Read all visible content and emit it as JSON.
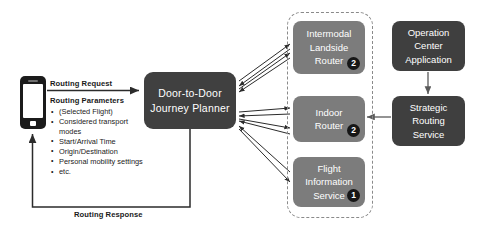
{
  "diagram": {
    "colors": {
      "dark_node": "#3f3f3f",
      "gray_node": "#7c7c7c",
      "badge": "#161616",
      "dashed_border": "#8a8a8a",
      "background": "#ffffff",
      "text_on_node": "#ffffff",
      "label_text": "#1a1a1a"
    }
  },
  "client": {
    "device_icon": "smartphone-icon"
  },
  "edges": {
    "routing_request_label": "Routing Request",
    "routing_response_label": "Routing Response"
  },
  "parameters": {
    "title": "Routing Parameters",
    "items": [
      "(Selected Flight)",
      "Considered transport modes",
      "Start/Arrival Time",
      "Origin/Destination",
      "Personal mobility settings",
      "etc."
    ]
  },
  "nodes": {
    "planner": {
      "line1": "Door-to-Door",
      "line2": "Journey Planner"
    },
    "intermodal_landside_router": {
      "line1": "Intermodal",
      "line2": "Landside",
      "line3": "Router",
      "badge": "2"
    },
    "indoor_router": {
      "line1": "Indoor",
      "line2": "Router",
      "badge": "2"
    },
    "flight_information_service": {
      "line1": "Flight",
      "line2": "Information",
      "line3": "Service",
      "badge": "1"
    },
    "operation_center_application": {
      "line1": "Operation",
      "line2": "Center",
      "line3": "Application"
    },
    "strategic_routing_service": {
      "line1": "Strategic",
      "line2": "Routing",
      "line3": "Service"
    }
  }
}
